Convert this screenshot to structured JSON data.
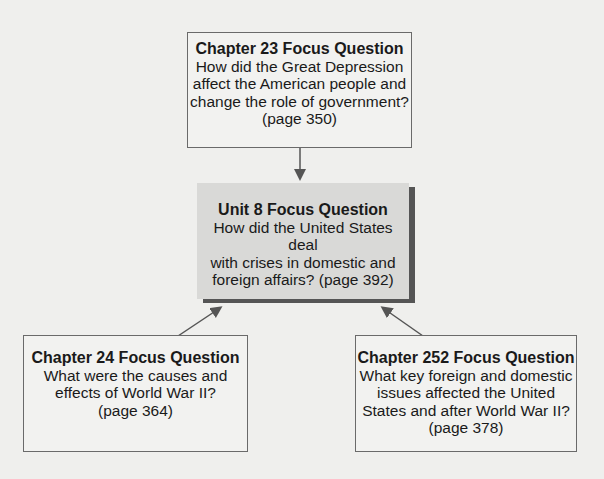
{
  "diagram": {
    "top_box": {
      "title": "Chapter 23 Focus Question",
      "lines": [
        "How did the Great Depression",
        "affect the American people and",
        "change the role of government?",
        "(page 350)"
      ]
    },
    "center_box": {
      "title": "Unit 8 Focus Question",
      "lines": [
        "How did the United States deal",
        "with crises in domestic and",
        "foreign affairs? (page 392)"
      ]
    },
    "left_box": {
      "title": "Chapter 24 Focus Question",
      "lines": [
        "What were the causes and",
        "effects of World War II?",
        "(page 364)"
      ]
    },
    "right_box": {
      "title": "Chapter 252 Focus Question",
      "lines": [
        "What key foreign and domestic",
        "issues affected the United",
        "States and after World War II?",
        "(page 378)"
      ]
    },
    "colors": {
      "arrow": "#555555",
      "border": "#6a6a6a",
      "center_fill": "#d9d9d7",
      "shadow": "#555555"
    }
  }
}
